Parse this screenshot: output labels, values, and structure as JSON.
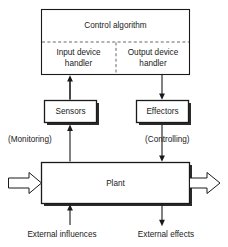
{
  "diagram": {
    "colors": {
      "stroke": "#1a1a1a",
      "dashed_stroke": "#555555",
      "background": "#ffffff",
      "shadow": "#2b2b2b"
    },
    "nodes": {
      "control_algorithm": "Control algorithm",
      "input_device_handler_line1": "Input device",
      "input_device_handler_line2": "handler",
      "output_device_handler_line1": "Output device",
      "output_device_handler_line2": "handler",
      "sensors": "Sensors",
      "effectors": "Effectors",
      "plant": "Plant"
    },
    "edge_labels": {
      "monitoring": "(Monitoring)",
      "controlling": "(Controlling)",
      "external_influences": "External influences",
      "external_effects": "External effects"
    }
  }
}
